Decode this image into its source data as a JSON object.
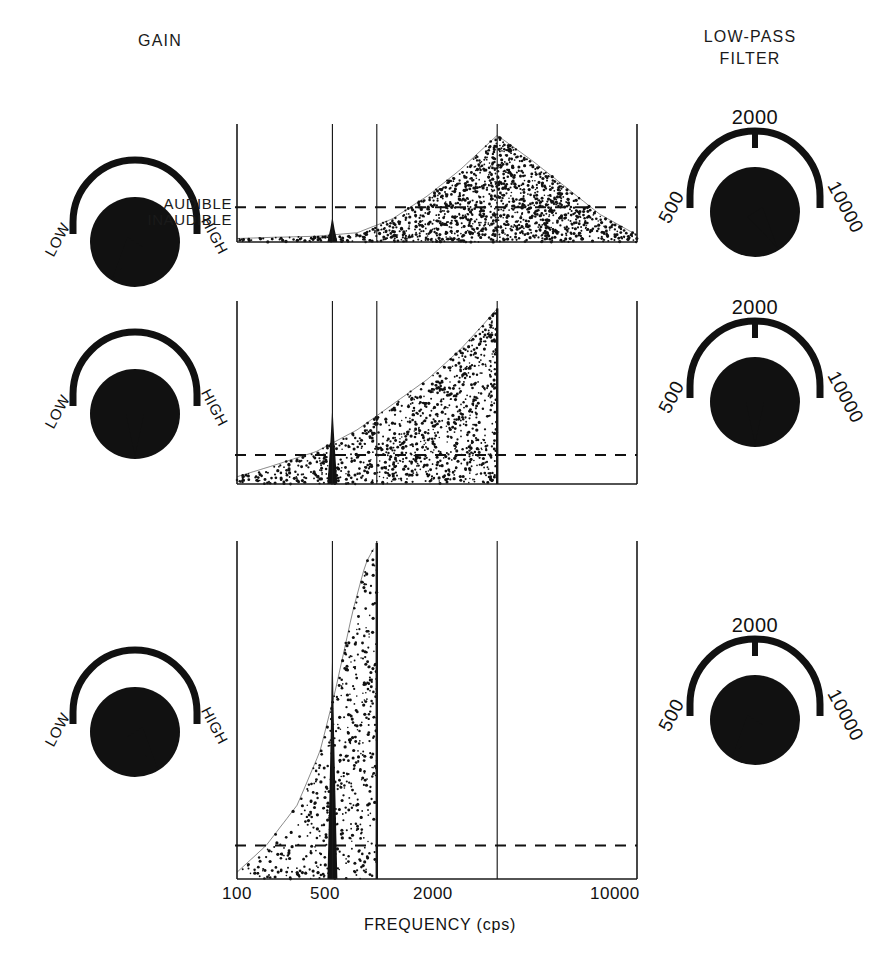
{
  "headers": {
    "gain": "GAIN",
    "filter_line1": "LOW-PASS",
    "filter_line2": "FILTER"
  },
  "threshold_labels": {
    "above": "AUDIBLE",
    "below": "INAUDIBLE"
  },
  "axis": {
    "title": "FREQUENCY (cps)",
    "ticks": [
      "100",
      "500",
      "2000",
      "10000"
    ],
    "tick_values": [
      100,
      500,
      2000,
      10000
    ]
  },
  "gain_knob_labels": {
    "min": "LOW",
    "max": "HIGH"
  },
  "filter_knob_labels": {
    "min": "500",
    "mid": "2000",
    "max": "10000"
  },
  "colors": {
    "ink": "#111111",
    "background": "#ffffff",
    "axis": "#1a1a1a"
  },
  "rows": [
    {
      "gain_setting": "LOW",
      "gain_angle_deg": -58,
      "filter_setting": "10000",
      "filter_angle_deg": 58,
      "cutoff_hz": 10000,
      "spike_hz": 300,
      "description": "Broad noise band peaking near 2000 cps, full bandwidth to 10000 cps"
    },
    {
      "gain_setting": "2000",
      "gain_angle_deg": 0,
      "filter_setting": "2000",
      "filter_angle_deg": 0,
      "cutoff_hz": 2000,
      "spike_hz": 300,
      "description": "Noise rising to a sharp cutoff at 2000 cps"
    },
    {
      "gain_setting": "HIGH",
      "gain_angle_deg": 58,
      "filter_setting": "500",
      "filter_angle_deg": -58,
      "cutoff_hz": 500,
      "spike_hz": 300,
      "description": "Narrow noise band cut off sharply at 500 cps with dominant spike"
    }
  ],
  "chart_data": {
    "type": "area",
    "title": "",
    "xlabel": "FREQUENCY (cps)",
    "ylabel": "",
    "xscale": "log",
    "xlim": [
      100,
      10000
    ],
    "xticks": [
      100,
      500,
      2000,
      10000
    ],
    "gridlines": [
      100,
      300,
      500,
      2000,
      10000
    ],
    "threshold_line": {
      "label_above": "AUDIBLE",
      "label_below": "INAUDIBLE",
      "style": "dashed"
    },
    "panels": [
      {
        "panel": 1,
        "gain": "LOW",
        "low_pass_filter": 10000,
        "threshold_frac": 0.3,
        "spike": {
          "hz": 300,
          "height_frac": 0.22
        },
        "envelope_x_hz": [
          100,
          150,
          250,
          400,
          600,
          900,
          1300,
          2000,
          3000,
          4500,
          6500,
          10000
        ],
        "envelope_y_frac": [
          0.03,
          0.04,
          0.05,
          0.08,
          0.2,
          0.4,
          0.62,
          0.92,
          0.7,
          0.46,
          0.24,
          0.06
        ]
      },
      {
        "panel": 2,
        "gain": "MID",
        "low_pass_filter": 2000,
        "threshold_frac": 0.16,
        "spike": {
          "hz": 300,
          "height_frac": 0.44
        },
        "envelope_x_hz": [
          100,
          150,
          250,
          400,
          600,
          900,
          1300,
          1700,
          2000
        ],
        "envelope_y_frac": [
          0.04,
          0.1,
          0.18,
          0.3,
          0.44,
          0.58,
          0.74,
          0.88,
          0.97
        ]
      },
      {
        "panel": 3,
        "gain": "HIGH",
        "low_pass_filter": 500,
        "threshold_frac": 0.1,
        "spike": {
          "hz": 300,
          "height_frac": 0.72
        },
        "envelope_x_hz": [
          100,
          140,
          200,
          260,
          310,
          380,
          440,
          500
        ],
        "envelope_y_frac": [
          0.02,
          0.1,
          0.22,
          0.38,
          0.56,
          0.8,
          0.94,
          1.0
        ]
      }
    ]
  }
}
